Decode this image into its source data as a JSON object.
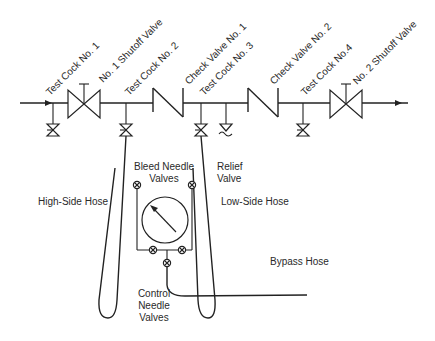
{
  "diagram": {
    "type": "piping schematic",
    "labels": {
      "test_cock_1": "Test Cock No. 1",
      "shutoff_valve_1": "No. 1 Shutoff Valve",
      "test_cock_2": "Test Cock No. 2",
      "check_valve_1": "Check Valve No. 1",
      "test_cock_3": "Test Cock No. 3",
      "check_valve_2": "Check Valve No. 2",
      "test_cock_4": "Test Cock No.4",
      "shutoff_valve_2": "No. 2 Shutoff Valve",
      "relief_valve_line1": "Relief",
      "relief_valve_line2": "Valve",
      "bleed_needle_line1": "Bleed Needle",
      "bleed_needle_line2": "Valves",
      "high_side_hose": "High-Side Hose",
      "low_side_hose": "Low-Side Hose",
      "bypass_hose": "Bypass Hose",
      "control_needle_line1": "Control",
      "control_needle_line2": "Needle",
      "control_needle_line3": "Valves"
    },
    "colors": {
      "line": "#222222",
      "text": "#2a2a2a",
      "background": "#ffffff"
    }
  }
}
